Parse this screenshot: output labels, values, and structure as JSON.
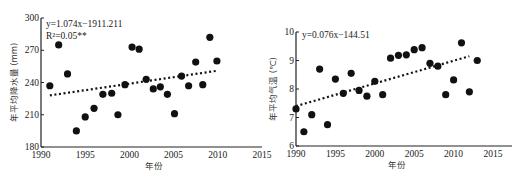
{
  "chart_data": [
    {
      "type": "scatter",
      "title": "",
      "xlabel": "年份",
      "ylabel": "年平均降水量 (mm)",
      "xlim": [
        1990,
        2015
      ],
      "ylim": [
        180,
        300
      ],
      "xticks": [
        "1990",
        "1995",
        "2000",
        "2005",
        "2010",
        "2015"
      ],
      "yticks": [
        "180",
        "210",
        "240",
        "270",
        "300"
      ],
      "grid": false,
      "equation": "y=1.074x−1911.211",
      "r_squared": "R²=0.05**",
      "trendline": {
        "style": "dotted",
        "x": [
          1991,
          2010
        ],
        "y": [
          228,
          251
        ]
      },
      "series": [
        {
          "name": "年平均降水量",
          "x": [
            1991,
            1992,
            1993,
            1994,
            1995,
            1996,
            1997,
            1998,
            1998.7,
            1999.5,
            2000.3,
            2001.1,
            2001.9,
            2002.7,
            2003.5,
            2004.3,
            2005.1,
            2005.9,
            2006.7,
            2007.5,
            2008.3,
            2009.1,
            2009.9
          ],
          "y": [
            237,
            275,
            248,
            195,
            208,
            216,
            229,
            230,
            210,
            238,
            273,
            271,
            243,
            234,
            236,
            229,
            211,
            246,
            237,
            259,
            238,
            282,
            260
          ]
        }
      ]
    },
    {
      "type": "scatter",
      "title": "",
      "xlabel": "年份",
      "ylabel": "年平均气温 (℃)",
      "xlim": [
        1990,
        2015
      ],
      "ylim": [
        6,
        10
      ],
      "xticks": [
        "1990",
        "1995",
        "2000",
        "2005",
        "2010",
        "2015"
      ],
      "yticks": [
        "6",
        "7",
        "8",
        "9",
        "10"
      ],
      "grid": false,
      "equation": "y=0.076x−144.51",
      "trendline": {
        "style": "dotted",
        "x": [
          1990,
          2012
        ],
        "y": [
          7.4,
          9.15
        ]
      },
      "series": [
        {
          "name": "年平均气温",
          "x": [
            1990,
            1991,
            1992,
            1993,
            1994,
            1995,
            1996,
            1997,
            1998,
            1999,
            2000,
            2001,
            2002,
            2003,
            2004,
            2005,
            2006,
            2007,
            2008,
            2009,
            2010,
            2011,
            2012,
            2013
          ],
          "y": [
            7.3,
            6.5,
            7.1,
            8.7,
            6.75,
            8.35,
            7.85,
            8.55,
            7.95,
            7.75,
            8.27,
            7.8,
            9.08,
            9.18,
            9.2,
            9.38,
            9.45,
            8.9,
            8.8,
            7.8,
            8.32,
            9.62,
            7.9,
            9.0
          ]
        }
      ]
    }
  ]
}
